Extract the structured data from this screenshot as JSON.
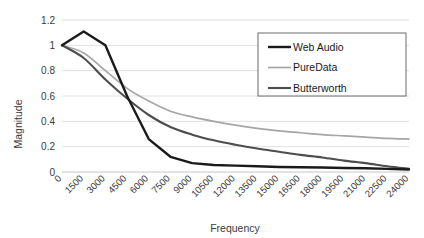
{
  "chart_data": {
    "type": "line",
    "title": "",
    "xlabel": "Frequency",
    "ylabel": "Magnitude",
    "xlim": [
      0,
      24000
    ],
    "ylim": [
      0,
      1.2
    ],
    "grid": true,
    "legend_position": "top-right",
    "y_ticks": [
      "0",
      "0.2",
      "0.4",
      "0.6",
      "0.8",
      "1",
      "1.2"
    ],
    "y_tick_values": [
      0,
      0.2,
      0.4,
      0.6,
      0.8,
      1,
      1.2
    ],
    "x_ticks": [
      "0",
      "1500",
      "3000",
      "4500",
      "6000",
      "7500",
      "9000",
      "10500",
      "12000",
      "13500",
      "15000",
      "16500",
      "18000",
      "19500",
      "21000",
      "22500",
      "24000"
    ],
    "x": [
      0,
      1500,
      3000,
      4500,
      6000,
      7500,
      9000,
      10500,
      12000,
      13500,
      15000,
      16500,
      18000,
      19500,
      21000,
      22500,
      24000
    ],
    "series": [
      {
        "name": "Web Audio",
        "color": "#1a1a1a",
        "width": 2.4,
        "smooth": false,
        "values": [
          1.0,
          1.11,
          1.0,
          0.6,
          0.26,
          0.12,
          0.07,
          0.055,
          0.05,
          0.045,
          0.04,
          0.038,
          0.035,
          0.032,
          0.03,
          0.025,
          0.02
        ]
      },
      {
        "name": "PureData",
        "color": "#a6a6a6",
        "width": 1.7,
        "smooth": true,
        "values": [
          1.0,
          0.94,
          0.8,
          0.66,
          0.56,
          0.48,
          0.435,
          0.4,
          0.37,
          0.345,
          0.325,
          0.31,
          0.295,
          0.285,
          0.275,
          0.265,
          0.26
        ]
      },
      {
        "name": "Butterworth",
        "color": "#4d4d4d",
        "width": 2.1,
        "smooth": true,
        "values": [
          1.0,
          0.9,
          0.73,
          0.58,
          0.45,
          0.355,
          0.295,
          0.25,
          0.215,
          0.185,
          0.16,
          0.135,
          0.115,
          0.09,
          0.07,
          0.045,
          0.025
        ]
      }
    ]
  },
  "legend": {
    "items": [
      {
        "label": "Web Audio"
      },
      {
        "label": "PureData"
      },
      {
        "label": "Butterworth"
      }
    ]
  },
  "axes": {
    "y_title": "Magnitude",
    "x_title": "Frequency"
  }
}
